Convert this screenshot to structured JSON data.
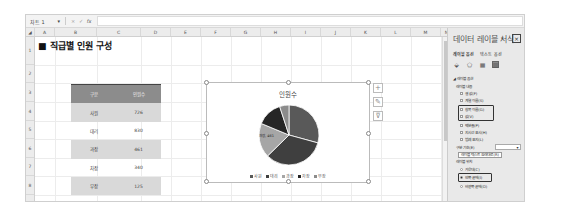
{
  "formula_bar": {
    "name_box": "차트 1",
    "cancel_icon": "×",
    "enter_icon": "✓",
    "fx_icon": "fx",
    "formula": ""
  },
  "columns": [
    "A",
    "B",
    "C",
    "D",
    "E",
    "F",
    "G",
    "H",
    "I",
    "J",
    "K",
    "L",
    "M",
    "N"
  ],
  "rows": [
    "1",
    "2",
    "3",
    "4",
    "5",
    "6",
    "7",
    "8",
    "9"
  ],
  "sheet": {
    "title": "■ 직급별 인원 구성",
    "table": {
      "headers": [
        "구분",
        "인원수"
      ],
      "rows": [
        {
          "label": "사원",
          "value": "726"
        },
        {
          "label": "대리",
          "value": "830"
        },
        {
          "label": "과장",
          "value": "461"
        },
        {
          "label": "차장",
          "value": "340"
        },
        {
          "label": "부장",
          "value": "125"
        }
      ]
    }
  },
  "chart_data": {
    "type": "pie",
    "title": "인원수",
    "categories": [
      "사원",
      "대리",
      "과장",
      "차장",
      "부장"
    ],
    "values": [
      726,
      830,
      461,
      340,
      125
    ],
    "colors": [
      "#595959",
      "#3f3f3f",
      "#a6a6a6",
      "#262626",
      "#8c8c8c"
    ],
    "visible_label": "과장, 461",
    "legend_position": "bottom"
  },
  "chart_buttons": [
    {
      "name": "chart-elements-button",
      "glyph": "+"
    },
    {
      "name": "chart-styles-button",
      "glyph": "✎"
    },
    {
      "name": "chart-filters-button",
      "glyph": "⊽"
    }
  ],
  "panel": {
    "title": "데이터 레이블 서식",
    "dropdown_glyph": "▾",
    "close_glyph": "×",
    "tabs": [
      "레이블 옵션",
      "텍스트 옵션"
    ],
    "section": "◢ 레이블 옵션",
    "subsection": "레이블 내용",
    "items": [
      {
        "label": "셀 값(F)",
        "checked": false
      },
      {
        "label": "계열 이름(S)",
        "checked": false
      },
      {
        "label": "항목 이름(G)",
        "checked": true,
        "highlighted": true
      },
      {
        "label": "값(V)",
        "checked": true,
        "highlighted": true
      },
      {
        "label": "백분율(P)",
        "checked": false
      },
      {
        "label": "지시선 표시(H)",
        "checked": true
      },
      {
        "label": "범례 표지(L)",
        "checked": false
      }
    ],
    "separator_label": "구분 기호(E)",
    "separator_value": "",
    "reset_button": "레이블 텍스트 원래대로(R)",
    "position_label": "레이블 위치",
    "positions": [
      {
        "label": "가운데(C)",
        "selected": false
      },
      {
        "label": "안쪽 끝에(I)",
        "selected": true,
        "highlighted": true
      },
      {
        "label": "바깥쪽 끝에(O)",
        "selected": false
      }
    ]
  }
}
